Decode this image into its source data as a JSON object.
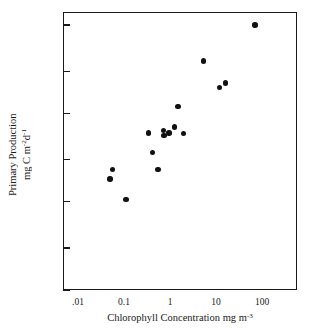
{
  "chart_data": {
    "type": "scatter",
    "title": "",
    "xlabel": "Chlorophyll Concentration mg m-3",
    "ylabel": "Primary Production mg C m-2d-1",
    "xscale": "log",
    "yscale": "log",
    "xlim": [
      0.004,
      400
    ],
    "ylim": [
      10,
      16000
    ],
    "grid": false,
    "legend": false,
    "x_tick_labels": [
      ".01",
      "0.1",
      "1",
      "10",
      "100"
    ],
    "x_tick_values": [
      0.01,
      0.1,
      1,
      10,
      100
    ],
    "y_tick_labels": [
      "10,000",
      "3,000",
      "1,000",
      "300",
      "100",
      "30",
      "10"
    ],
    "y_tick_values": [
      10000,
      3000,
      1000,
      300,
      100,
      30,
      10
    ],
    "marker": "filled-circle",
    "marker_color": "#111111",
    "points": [
      {
        "x": 0.05,
        "y": 180
      },
      {
        "x": 0.056,
        "y": 230
      },
      {
        "x": 0.11,
        "y": 105
      },
      {
        "x": 0.34,
        "y": 600
      },
      {
        "x": 0.42,
        "y": 360
      },
      {
        "x": 0.55,
        "y": 230
      },
      {
        "x": 0.72,
        "y": 640
      },
      {
        "x": 0.74,
        "y": 560
      },
      {
        "x": 0.95,
        "y": 600
      },
      {
        "x": 1.25,
        "y": 700
      },
      {
        "x": 1.5,
        "y": 1200
      },
      {
        "x": 1.95,
        "y": 590
      },
      {
        "x": 5.4,
        "y": 3900
      },
      {
        "x": 12.0,
        "y": 1950
      },
      {
        "x": 16.0,
        "y": 2200
      },
      {
        "x": 70.0,
        "y": 10000
      }
    ]
  },
  "axes": {
    "x_title_main": "Chlorophyll Concentration mg m",
    "x_title_exp": "-3",
    "y_title_line1": "Primary Production",
    "y_title_line2_a": "mg C m",
    "y_title_line2_exp1": "-2",
    "y_title_line2_b": "d",
    "y_title_line2_exp2": "-1"
  },
  "colors": {
    "marker": "#111111",
    "axis": "#1a1a1a",
    "background": "#ffffff"
  }
}
